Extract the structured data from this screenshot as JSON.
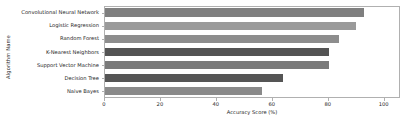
{
  "chart_data": {
    "type": "bar",
    "orientation": "horizontal",
    "title": "",
    "xlabel": "Accuracy Score (%)",
    "ylabel": "Algorithm Name",
    "categories": [
      "Convolutional Neural Network",
      "Logistic Regression",
      "Random Forest",
      "K-Nearest Neighbors",
      "Support Vector Machine",
      "Decision Tree",
      "Naive Bayes"
    ],
    "values": [
      92.5,
      89.8,
      83.6,
      80.2,
      80.0,
      63.5,
      56.0
    ],
    "bar_colors": [
      "#7f7f7f",
      "#9a9a9a",
      "#8d8d8d",
      "#545454",
      "#7a7a7a",
      "#555555",
      "#8a8a8a"
    ],
    "xlim": [
      0,
      105.5
    ],
    "xticks": [
      0,
      20,
      40,
      60,
      80,
      100
    ],
    "xtick_labels": [
      "0",
      "20",
      "40",
      "60",
      "80",
      "100"
    ],
    "grid": false,
    "legend": null,
    "axis_color": "#b0b0b0",
    "text_color": "#262626",
    "background": "#ffffff"
  }
}
